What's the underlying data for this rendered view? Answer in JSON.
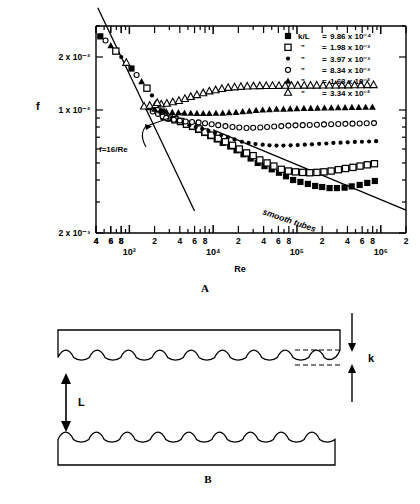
{
  "figure": {
    "panel_a_letter": "A",
    "panel_b_letter": "B"
  },
  "chart_data": {
    "type": "scatter",
    "title": "",
    "xlabel": "Re",
    "ylabel": "f",
    "xscale": "log",
    "yscale": "log",
    "xlim": [
      400,
      2000000
    ],
    "ylim": [
      0.002,
      0.03
    ],
    "grid": false,
    "legend_position": "top-right",
    "x_decade_labels": [
      "10³",
      "10⁴",
      "10⁵",
      "10⁶"
    ],
    "x_minor_labels": [
      "4",
      "6",
      "8",
      "2",
      "4",
      "6",
      "8",
      "2",
      "4",
      "6",
      "8",
      "2",
      "4",
      "6",
      "8",
      "2"
    ],
    "y_tick_labels": [
      "2 x 10⁻²",
      "1 x 10⁻²",
      "2 x 10⁻³"
    ],
    "y_tick_values": [
      0.02,
      0.01,
      0.002
    ],
    "annotations": [
      {
        "name": "laminar-law",
        "text": "f=16/Re"
      },
      {
        "name": "smooth-tubes-line",
        "text": "smooth tubes"
      }
    ],
    "legend_header_symbol": "k/L",
    "ditto_mark": "\"",
    "series": [
      {
        "name": "k/L = 9.86 x 10-4",
        "marker": "filled-square",
        "legend_label": "k/L = 9.86 x 10⁻⁴",
        "k_over_L": 0.000986,
        "x": [
          2600,
          3000,
          3500,
          4000,
          4800,
          5600,
          6600,
          7800,
          9200,
          11000,
          13000,
          16000,
          19000,
          23000,
          28000,
          34000,
          41000,
          50000,
          61000,
          74000,
          90000,
          110000,
          135000,
          165000,
          200000,
          245000,
          300000,
          370000,
          450000,
          560000,
          690000,
          850000
        ],
        "y": [
          0.0092,
          0.009,
          0.0088,
          0.0086,
          0.0083,
          0.008,
          0.0077,
          0.0074,
          0.0071,
          0.0068,
          0.0065,
          0.0062,
          0.0059,
          0.0056,
          0.0053,
          0.005,
          0.0048,
          0.0046,
          0.0044,
          0.0042,
          0.004,
          0.0039,
          0.0038,
          0.0037,
          0.00365,
          0.0036,
          0.0036,
          0.00362,
          0.00368,
          0.00375,
          0.00385,
          0.00395
        ]
      },
      {
        "name": "k/L = 1.98 x 10-3",
        "marker": "open-square",
        "legend_label": "1.98 x 10⁻³",
        "k_over_L": 0.00198,
        "x": [
          2600,
          3000,
          3500,
          4100,
          4800,
          5700,
          6800,
          8000,
          9500,
          11500,
          14000,
          17000,
          20500,
          25000,
          30000,
          36000,
          44000,
          53000,
          65000,
          79000,
          96000,
          117000,
          142000,
          173000,
          210000,
          256000,
          312000,
          380000,
          465000,
          566000,
          690000,
          840000
        ],
        "y": [
          0.0092,
          0.009,
          0.0088,
          0.0086,
          0.0083,
          0.0081,
          0.0078,
          0.0075,
          0.0072,
          0.0069,
          0.0066,
          0.0063,
          0.006,
          0.0057,
          0.0055,
          0.0052,
          0.005,
          0.0048,
          0.0046,
          0.0045,
          0.00445,
          0.00442,
          0.0044,
          0.00442,
          0.00445,
          0.0045,
          0.00458,
          0.00465,
          0.00472,
          0.0048,
          0.00488,
          0.00495
        ]
      },
      {
        "name": "k/L = 3.97 x 10-3",
        "marker": "small-filled-circle",
        "legend_label": "3.97 x 10⁻³",
        "k_over_L": 0.00397,
        "x": [
          2600,
          3100,
          3700,
          4400,
          5200,
          6200,
          7400,
          8800,
          10500,
          12500,
          15000,
          18000,
          22000,
          26500,
          32000,
          39000,
          47000,
          57000,
          69000,
          84000,
          102000,
          124000,
          151000,
          184000,
          224000,
          272000,
          331000,
          403000,
          490000,
          596000,
          725000,
          880000
        ],
        "y": [
          0.0092,
          0.0089,
          0.0087,
          0.0085,
          0.0082,
          0.008,
          0.0078,
          0.0076,
          0.0074,
          0.0072,
          0.007,
          0.0068,
          0.0066,
          0.0065,
          0.0064,
          0.00635,
          0.0063,
          0.00628,
          0.00628,
          0.0063,
          0.00632,
          0.00635,
          0.00638,
          0.00642,
          0.00645,
          0.0065,
          0.00652,
          0.00655,
          0.00658,
          0.0066,
          0.00662,
          0.00665
        ]
      },
      {
        "name": "k/L = 8.34 x 10-3",
        "marker": "open-circle",
        "legend_label": "8.34 x 10⁻³",
        "k_over_L": 0.00834,
        "x": [
          1900,
          2200,
          2500,
          2900,
          3400,
          4000,
          4700,
          5600,
          6700,
          8000,
          9600,
          11500,
          14000,
          17000,
          20500,
          25000,
          30000,
          36500,
          44000,
          53500,
          65000,
          79000,
          96000,
          117000,
          142000,
          173000,
          210000,
          256000,
          311000,
          378000,
          460000,
          560000,
          680000,
          830000
        ],
        "y": [
          0.0098,
          0.0095,
          0.0092,
          0.009,
          0.0088,
          0.0087,
          0.0086,
          0.00855,
          0.0085,
          0.0084,
          0.0083,
          0.0082,
          0.0081,
          0.008,
          0.00795,
          0.0079,
          0.00792,
          0.00795,
          0.008,
          0.00805,
          0.0081,
          0.00815,
          0.00818,
          0.0082,
          0.00822,
          0.00825,
          0.00828,
          0.0083,
          0.00832,
          0.00834,
          0.00836,
          0.00838,
          0.0084,
          0.00842
        ]
      },
      {
        "name": "k/L = 1.63 x 10-2",
        "marker": "filled-triangle",
        "legend_label": "1.63 x 10⁻²",
        "k_over_L": 0.0163,
        "x": [
          1700,
          2000,
          2350,
          2750,
          3250,
          3850,
          4550,
          5400,
          6400,
          7600,
          9000,
          10800,
          13000,
          15500,
          18700,
          22500,
          27000,
          32500,
          39000,
          47000,
          57000,
          69000,
          83000,
          100000,
          121000,
          146000,
          176000,
          213000,
          257000,
          310000,
          375000,
          452000,
          546000,
          660000,
          795000
        ],
        "y": [
          0.0103,
          0.0101,
          0.0099,
          0.0098,
          0.0097,
          0.00965,
          0.0096,
          0.00958,
          0.00956,
          0.00955,
          0.00955,
          0.00958,
          0.0096,
          0.00965,
          0.0097,
          0.00978,
          0.00985,
          0.00995,
          0.01,
          0.01005,
          0.0101,
          0.01012,
          0.01015,
          0.01018,
          0.0102,
          0.01022,
          0.01024,
          0.01026,
          0.01028,
          0.0103,
          0.01032,
          0.01034,
          0.01035,
          0.01036,
          0.01038
        ]
      },
      {
        "name": "k/L = 3.34 x 10-2",
        "marker": "open-triangle",
        "legend_label": "3.34 x 10⁻²",
        "k_over_L": 0.0334,
        "x": [
          1500,
          1750,
          2050,
          2400,
          2800,
          3300,
          3900,
          4600,
          5400,
          6400,
          7600,
          9000,
          10700,
          12700,
          15100,
          18000,
          21400,
          25500,
          30300,
          36000,
          43000,
          51000,
          61000,
          72500,
          86000,
          102000,
          122000,
          145000,
          172000,
          205000,
          244000,
          290000,
          345000,
          410000,
          487000,
          580000,
          690000,
          820000
        ],
        "y": [
          0.0105,
          0.0106,
          0.0107,
          0.0108,
          0.0109,
          0.0111,
          0.0113,
          0.0116,
          0.0119,
          0.0122,
          0.0125,
          0.0128,
          0.013,
          0.0132,
          0.0134,
          0.0135,
          0.01358,
          0.01365,
          0.0137,
          0.01372,
          0.01374,
          0.01375,
          0.01376,
          0.01377,
          0.01378,
          0.01379,
          0.0138,
          0.0138,
          0.01381,
          0.01382,
          0.01383,
          0.01384,
          0.01385,
          0.01386,
          0.01387,
          0.01388,
          0.01389,
          0.0139
        ]
      },
      {
        "name": "laminar branch f=16/Re",
        "marker": "mixed-laminar",
        "legend_label": "",
        "x": [
          450,
          520,
          600,
          690,
          800,
          920,
          1060,
          1220,
          1400,
          1620,
          1860,
          2150,
          2450,
          2750
        ],
        "y": [
          0.0262,
          0.0248,
          0.0232,
          0.0216,
          0.02,
          0.0186,
          0.0172,
          0.0158,
          0.0145,
          0.0133,
          0.0121,
          0.011,
          0.0098,
          0.009
        ]
      }
    ],
    "smooth_tube_line": {
      "name": "smooth tubes",
      "x": [
        10000,
        2000000
      ],
      "y": [
        0.0077,
        0.0027
      ]
    },
    "laminar_line": {
      "name": "f=16/Re",
      "x": [
        420,
        6000
      ],
      "y": [
        0.0381,
        0.00267
      ]
    }
  },
  "panel_b": {
    "label_k": "k",
    "label_L": "L",
    "caption": "B",
    "wave_count": 9,
    "upper_plate": "rough-plate-upper",
    "lower_plate": "rough-plate-lower"
  }
}
